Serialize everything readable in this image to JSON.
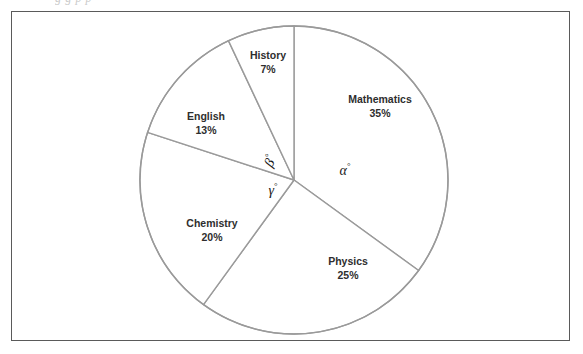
{
  "page": {
    "clipped_caption": "g g  p         p",
    "background_color": "#ffffff",
    "frame_color": "#5a5a5a"
  },
  "chart_data": {
    "type": "pie",
    "title": "",
    "subtitle": "",
    "xlabel": "",
    "ylabel": "",
    "legend_position": "none",
    "grid": false,
    "labels_inside": true,
    "center": {
      "x": 294,
      "y": 180
    },
    "radius": 154,
    "start_angle_deg": -90,
    "direction": "clockwise",
    "stroke_color": "#9a9a9a",
    "slice_fill": "#ffffff",
    "categories": [
      "Mathematics",
      "Physics",
      "Chemistry",
      "English",
      "History"
    ],
    "values": [
      35,
      25,
      20,
      13,
      7
    ],
    "units": "%",
    "slices": [
      {
        "name": "Mathematics",
        "label": "Mathematics",
        "percent_text": "35%",
        "value": 35,
        "degrees": 126,
        "start_deg": -90,
        "end_deg": 36,
        "label_x": 380,
        "label_y": 106
      },
      {
        "name": "Physics",
        "label": "Physics",
        "percent_text": "25%",
        "value": 25,
        "degrees": 90,
        "start_deg": 36,
        "end_deg": 126,
        "label_x": 348,
        "label_y": 268
      },
      {
        "name": "Chemistry",
        "label": "Chemistry",
        "percent_text": "20%",
        "value": 20,
        "degrees": 72,
        "start_deg": 126,
        "end_deg": 198,
        "label_x": 212,
        "label_y": 230
      },
      {
        "name": "English",
        "label": "English",
        "percent_text": "13%",
        "value": 13,
        "degrees": 46.8,
        "start_deg": 198,
        "end_deg": 244.8,
        "label_x": 206,
        "label_y": 123
      },
      {
        "name": "History",
        "label": "History",
        "percent_text": "7%",
        "value": 7,
        "degrees": 25.2,
        "start_deg": 244.8,
        "end_deg": 270,
        "label_x": 268,
        "label_y": 62
      }
    ],
    "annotations": [
      {
        "name": "alpha",
        "text": "α",
        "degree_symbol": "°",
        "belongs_to": "Mathematics",
        "x": 345,
        "y": 170
      },
      {
        "name": "beta",
        "text": "β",
        "degree_symbol": "°",
        "belongs_to": "English",
        "x": 270,
        "y": 161,
        "rotated": true
      },
      {
        "name": "gamma",
        "text": "γ",
        "degree_symbol": "°",
        "belongs_to": "Chemistry",
        "x": 273,
        "y": 190
      }
    ]
  }
}
